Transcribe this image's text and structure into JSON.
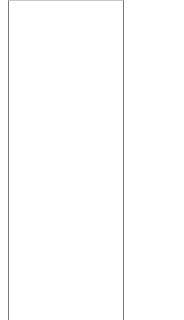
{
  "panel": {
    "content": "",
    "border_color": "#7a7a7a",
    "background": "#ffffff"
  }
}
